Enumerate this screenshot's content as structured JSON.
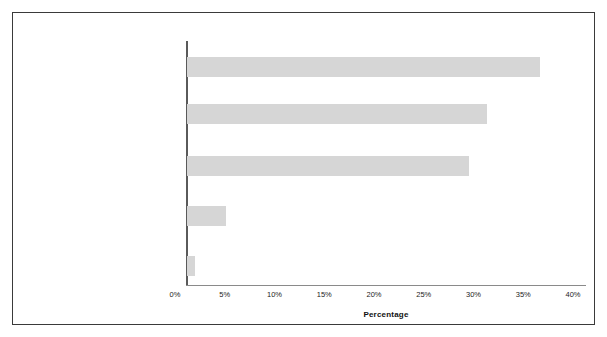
{
  "chart_data": {
    "type": "bar",
    "orientation": "horizontal",
    "title": "",
    "xlabel": "Percentage",
    "ylabel": "",
    "xlim": [
      0,
      40
    ],
    "xtick_labels": [
      "0%",
      "5%",
      "10%",
      "15%",
      "20%",
      "25%",
      "30%",
      "35%",
      "40%"
    ],
    "xticks": [
      0,
      5,
      10,
      15,
      20,
      25,
      30,
      35,
      40
    ],
    "grid": false,
    "legend": false,
    "bar_color": "#d6d6d6",
    "categories": [
      "Neglect only (35.5%)",
      "Multiple maltreatment types (30.2%)",
      "Physical abuse only (28.3%)",
      "Phychological maltreatment only, other only, or unknown only (3.9%)",
      "Sexual abuse only (0.8%)"
    ],
    "category_lines": [
      [
        "Neglect only (35.5%)"
      ],
      [
        "Multiple maltreatment types (30.2%)"
      ],
      [
        "Physical abuse only (28.3%)"
      ],
      [
        "Phychological maltreatment only, other",
        "only, or unknown only (3.9%)"
      ],
      [
        "Sexual abuse only (0.8%)"
      ]
    ],
    "values": [
      35.5,
      30.2,
      28.3,
      3.9,
      0.8
    ],
    "value_labels": [
      "35.5%",
      "30.2%",
      "28.3%",
      "3.9%",
      "0.8%"
    ]
  },
  "figure": {
    "border_color": "#3a3a3a",
    "background": "#ffffff"
  }
}
